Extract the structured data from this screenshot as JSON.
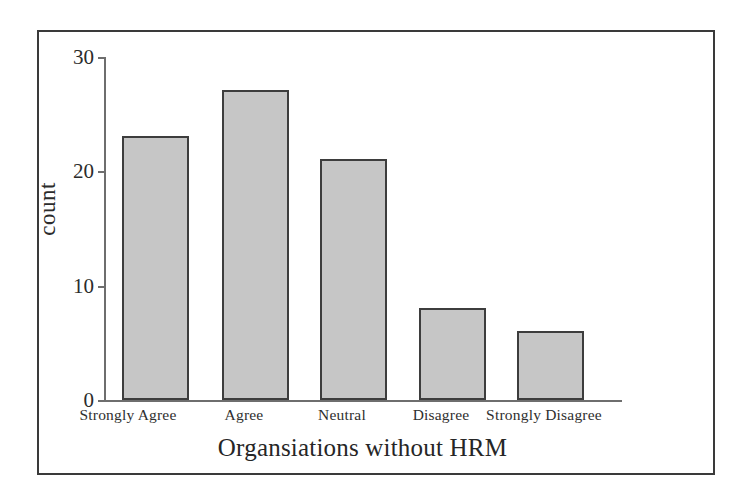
{
  "chart_data": {
    "type": "bar",
    "title": "",
    "xlabel": "Organsiations without HRM",
    "ylabel": "count",
    "categories": [
      "Strongly Agree",
      "Agree",
      "Neutral",
      "Disagree",
      "Strongly Disagree"
    ],
    "values": [
      23,
      27,
      21,
      8,
      6
    ],
    "ylim": [
      0,
      30
    ],
    "yticks": [
      0,
      10,
      20,
      30
    ],
    "ytick_labels": [
      "0",
      "10",
      "20",
      "30"
    ],
    "grid": false,
    "legend": null,
    "bar_fill_color": "#c6c6c6",
    "bar_edge_color": "#3d3d3d",
    "axis_color": "#6e6e6e",
    "frame_color": "#3a3a3a",
    "background_color": "#ffffff"
  }
}
